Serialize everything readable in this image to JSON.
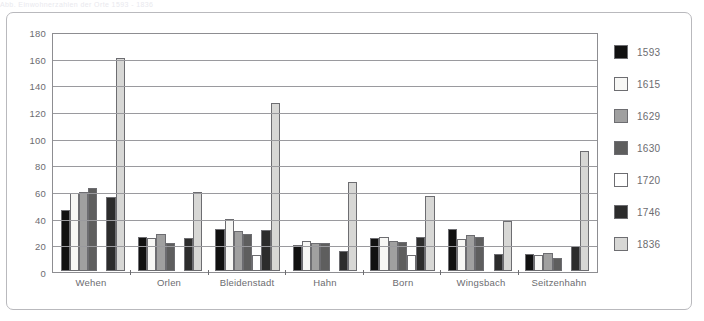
{
  "top_sliver_text": "Abb. Einwohnerzahlen der Orte 1593 - 1836",
  "chart_data": {
    "type": "bar",
    "title": "",
    "xlabel": "",
    "ylabel": "",
    "ylim": [
      0,
      180
    ],
    "ytick_step": 20,
    "yticks": [
      180,
      160,
      140,
      120,
      100,
      80,
      60,
      40,
      20,
      0
    ],
    "grid": true,
    "legend_position": "right",
    "categories": [
      "Wehen",
      "Orlen",
      "Bleidenstadt",
      "Hahn",
      "Born",
      "Wingsbach",
      "Seitzenhahn"
    ],
    "series": [
      {
        "name": "1593",
        "color": "#111111",
        "values": [
          46,
          26,
          32,
          20,
          25,
          32,
          13
        ]
      },
      {
        "name": "1615",
        "color": "#f7f7f5",
        "values": [
          59,
          25,
          39,
          23,
          26,
          24,
          12
        ]
      },
      {
        "name": "1629",
        "color": "#a0a0a0",
        "values": [
          60,
          28,
          30,
          21,
          23,
          27,
          14
        ]
      },
      {
        "name": "1630",
        "color": "#5e5e5e",
        "values": [
          63,
          21,
          28,
          21,
          22,
          26,
          10
        ]
      },
      {
        "name": "1720",
        "color": "#ffffff",
        "values": [
          0,
          0,
          12,
          0,
          12,
          0,
          0
        ]
      },
      {
        "name": "1746",
        "color": "#2c2c2c",
        "values": [
          56,
          25,
          31,
          15,
          26,
          13,
          19
        ]
      },
      {
        "name": "1836",
        "color": "#d7d7d5",
        "values": [
          161,
          60,
          127,
          67,
          57,
          38,
          91
        ]
      }
    ]
  }
}
